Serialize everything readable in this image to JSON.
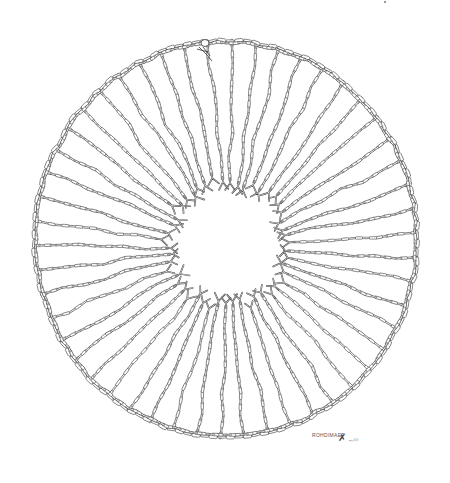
{
  "illustration": {
    "subject": "circular chain with radiating spokes ending in forked tips",
    "style": "black ink line drawing on white",
    "colors": {
      "background": "#ffffff",
      "ink": "#333333",
      "link_fill": "#ffffff"
    },
    "ring": {
      "cx": 226,
      "cy": 239,
      "rx": 192,
      "ry": 199
    },
    "inner_void": {
      "cx": 228,
      "cy": 245,
      "r": 62
    },
    "spoke_count": 50,
    "clasp": {
      "x": 205,
      "y": 45
    }
  },
  "signature": {
    "text": "ROHDIMAEF",
    "mark": "✗",
    "tail": "~ᵒ⁾"
  }
}
